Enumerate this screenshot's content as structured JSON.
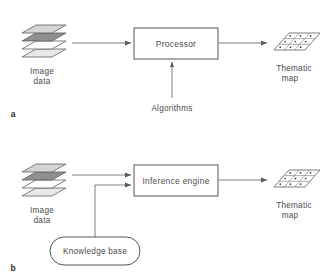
{
  "figure": {
    "type": "block-flow-diagram",
    "background_color": "#ffffff",
    "line_color": "#6d6d6d",
    "text_color": "#4a4a4a"
  },
  "panels": [
    {
      "letter": "a",
      "input_label_line1": "Image",
      "input_label_line2": "data",
      "process_box_label": "Processor",
      "output_label_line1": "Thematic",
      "output_label_line2": "map",
      "aux_label": "Algorithms",
      "aux_shape": "none"
    },
    {
      "letter": "b",
      "input_label_line1": "Image",
      "input_label_line2": "data",
      "process_box_label": "Inference engine",
      "output_label_line1": "Thematic",
      "output_label_line2": "map",
      "aux_label": "Knowledge base",
      "aux_shape": "stadium"
    }
  ],
  "image_stack": {
    "layer_count": 4,
    "layer_fills": [
      "#d4d4d4",
      "#8f8f8f",
      "#ffffff",
      "#e8e8e8"
    ],
    "shape": "parallelogram"
  },
  "thematic_map": {
    "grid_rows": 3,
    "grid_cols": 3,
    "cell_marker": "dot",
    "fill": "#ffffff",
    "shape": "parallelogram"
  },
  "icons": {
    "arrow": "arrow-right-icon",
    "arrow_up": "arrow-up-icon",
    "stack": "layer-stack-icon",
    "grid": "grid-map-icon"
  }
}
